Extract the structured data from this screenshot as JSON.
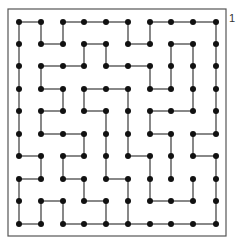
{
  "figure": {
    "label": "1",
    "frame": {
      "x": 8,
      "y": 9,
      "width": 218,
      "height": 227
    },
    "colors": {
      "frame": "#555555",
      "edge": "#555555",
      "node": "#111111",
      "background": "#ffffff"
    },
    "grid": {
      "cols": 10,
      "rows": 10,
      "col_x": [
        19,
        41,
        63,
        84,
        106,
        128,
        150,
        171,
        193,
        216
      ],
      "row_y": [
        22,
        44,
        66,
        89,
        111,
        134,
        156,
        179,
        201,
        224
      ]
    },
    "horizontal_edges": [
      [
        0,
        0
      ],
      [
        0,
        2
      ],
      [
        0,
        3
      ],
      [
        0,
        4
      ],
      [
        0,
        6
      ],
      [
        0,
        7
      ],
      [
        0,
        8
      ],
      [
        1,
        1
      ],
      [
        1,
        3
      ],
      [
        1,
        5
      ],
      [
        1,
        7
      ],
      [
        2,
        1
      ],
      [
        2,
        2
      ],
      [
        2,
        4
      ],
      [
        2,
        5
      ],
      [
        3,
        1
      ],
      [
        3,
        3
      ],
      [
        3,
        4
      ],
      [
        3,
        6
      ],
      [
        4,
        1
      ],
      [
        4,
        3
      ],
      [
        4,
        6
      ],
      [
        4,
        7
      ],
      [
        5,
        1
      ],
      [
        5,
        2
      ],
      [
        5,
        6
      ],
      [
        5,
        8
      ],
      [
        6,
        0
      ],
      [
        6,
        2
      ],
      [
        6,
        5
      ],
      [
        6,
        8
      ],
      [
        7,
        0
      ],
      [
        7,
        2
      ],
      [
        7,
        4
      ],
      [
        8,
        1
      ],
      [
        8,
        3
      ],
      [
        8,
        6
      ],
      [
        8,
        7
      ],
      [
        9,
        0
      ],
      [
        9,
        2
      ],
      [
        9,
        3
      ],
      [
        9,
        4
      ],
      [
        9,
        5
      ],
      [
        9,
        6
      ],
      [
        9,
        7
      ],
      [
        9,
        8
      ]
    ],
    "vertical_edges": [
      [
        0,
        0
      ],
      [
        0,
        1
      ],
      [
        0,
        2
      ],
      [
        0,
        3
      ],
      [
        0,
        4
      ],
      [
        0,
        5
      ],
      [
        0,
        7
      ],
      [
        0,
        8
      ],
      [
        1,
        0
      ],
      [
        1,
        2
      ],
      [
        1,
        4
      ],
      [
        1,
        6
      ],
      [
        1,
        8
      ],
      [
        2,
        0
      ],
      [
        2,
        3
      ],
      [
        2,
        6
      ],
      [
        2,
        8
      ],
      [
        3,
        1
      ],
      [
        3,
        3
      ],
      [
        3,
        5
      ],
      [
        3,
        7
      ],
      [
        4,
        1
      ],
      [
        4,
        4
      ],
      [
        4,
        5
      ],
      [
        4,
        6
      ],
      [
        4,
        8
      ],
      [
        5,
        0
      ],
      [
        5,
        3
      ],
      [
        5,
        4
      ],
      [
        5,
        5
      ],
      [
        5,
        7
      ],
      [
        5,
        8
      ],
      [
        6,
        0
      ],
      [
        6,
        2
      ],
      [
        6,
        4
      ],
      [
        6,
        6
      ],
      [
        6,
        7
      ],
      [
        7,
        1
      ],
      [
        7,
        2
      ],
      [
        7,
        5
      ],
      [
        7,
        6
      ],
      [
        8,
        1
      ],
      [
        8,
        2
      ],
      [
        8,
        3
      ],
      [
        8,
        5
      ],
      [
        8,
        7
      ],
      [
        9,
        0
      ],
      [
        9,
        1
      ],
      [
        9,
        2
      ],
      [
        9,
        3
      ],
      [
        9,
        4
      ],
      [
        9,
        6
      ],
      [
        9,
        7
      ],
      [
        9,
        8
      ]
    ],
    "edge_format_note": "horizontal: [row, col] connects col->col+1; vertical: [col, row] connects row->row+1"
  }
}
